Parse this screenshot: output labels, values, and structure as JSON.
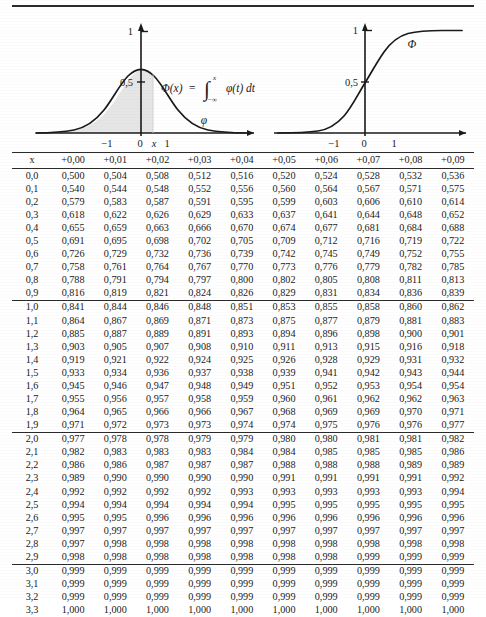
{
  "page": {
    "rule_color": "#2b2b2b"
  },
  "figures": [
    {
      "name": "density-figure",
      "caption_formula": "Φ(x) = ∫  φ(t) dt",
      "curve_label": "φ",
      "integral_symbol": "∫",
      "integral_upper": "x",
      "integral_lower": "−∞",
      "formula_lhs": "Φ(x)",
      "formula_eq": "=",
      "formula_integrand": "φ(t) dt",
      "y_ticks": [
        "1",
        "0,5"
      ],
      "x_ticks": [
        "−1",
        "0",
        "x",
        "1"
      ],
      "shaded": true,
      "shade_color": "#e6e6e6"
    },
    {
      "name": "cdf-figure",
      "curve_label": "Φ",
      "y_ticks": [
        "1",
        "0,5"
      ],
      "x_ticks": [
        "−1",
        "0",
        "1"
      ],
      "shaded": false
    }
  ],
  "table": {
    "columns": [
      "x",
      "+0,00",
      "+0,01",
      "+0,02",
      "+0,03",
      "+0,04",
      "+0,05",
      "+0,06",
      "+0,07",
      "+0,08",
      "+0,09"
    ],
    "blocks": [
      {
        "rows": [
          {
            "x": "0,0",
            "values": [
              "0,500",
              "0,504",
              "0,508",
              "0,512",
              "0,516",
              "0,520",
              "0,524",
              "0,528",
              "0,532",
              "0,536"
            ]
          },
          {
            "x": "0,1",
            "values": [
              "0,540",
              "0,544",
              "0,548",
              "0,552",
              "0,556",
              "0,560",
              "0,564",
              "0,567",
              "0,571",
              "0,575"
            ]
          },
          {
            "x": "0,2",
            "values": [
              "0,579",
              "0,583",
              "0,587",
              "0,591",
              "0,595",
              "0,599",
              "0,603",
              "0,606",
              "0,610",
              "0,614"
            ]
          },
          {
            "x": "0,3",
            "values": [
              "0,618",
              "0,622",
              "0,626",
              "0,629",
              "0,633",
              "0,637",
              "0,641",
              "0,644",
              "0,648",
              "0,652"
            ]
          },
          {
            "x": "0,4",
            "values": [
              "0,655",
              "0,659",
              "0,663",
              "0,666",
              "0,670",
              "0,674",
              "0,677",
              "0,681",
              "0,684",
              "0,688"
            ]
          },
          {
            "x": "0,5",
            "values": [
              "0,691",
              "0,695",
              "0,698",
              "0,702",
              "0,705",
              "0,709",
              "0,712",
              "0,716",
              "0,719",
              "0,722"
            ]
          },
          {
            "x": "0,6",
            "values": [
              "0,726",
              "0,729",
              "0,732",
              "0,736",
              "0,739",
              "0,742",
              "0,745",
              "0,749",
              "0,752",
              "0,755"
            ]
          },
          {
            "x": "0,7",
            "values": [
              "0,758",
              "0,761",
              "0,764",
              "0,767",
              "0,770",
              "0,773",
              "0,776",
              "0,779",
              "0,782",
              "0,785"
            ]
          },
          {
            "x": "0,8",
            "values": [
              "0,788",
              "0,791",
              "0,794",
              "0,797",
              "0,800",
              "0,802",
              "0,805",
              "0,808",
              "0,811",
              "0,813"
            ]
          },
          {
            "x": "0,9",
            "values": [
              "0,816",
              "0,819",
              "0,821",
              "0,824",
              "0,826",
              "0,829",
              "0,831",
              "0,834",
              "0,836",
              "0,839"
            ]
          }
        ]
      },
      {
        "rows": [
          {
            "x": "1,0",
            "values": [
              "0,841",
              "0,844",
              "0,846",
              "0,848",
              "0,851",
              "0,853",
              "0,855",
              "0,858",
              "0,860",
              "0,862"
            ]
          },
          {
            "x": "1,1",
            "values": [
              "0,864",
              "0,867",
              "0,869",
              "0,871",
              "0,873",
              "0,875",
              "0,877",
              "0,879",
              "0,881",
              "0,883"
            ]
          },
          {
            "x": "1,2",
            "values": [
              "0,885",
              "0,887",
              "0,889",
              "0,891",
              "0,893",
              "0,894",
              "0,896",
              "0,898",
              "0,900",
              "0,901"
            ]
          },
          {
            "x": "1,3",
            "values": [
              "0,903",
              "0,905",
              "0,907",
              "0,908",
              "0,910",
              "0,911",
              "0,913",
              "0,915",
              "0,916",
              "0,918"
            ]
          },
          {
            "x": "1,4",
            "values": [
              "0,919",
              "0,921",
              "0,922",
              "0,924",
              "0,925",
              "0,926",
              "0,928",
              "0,929",
              "0,931",
              "0,932"
            ]
          },
          {
            "x": "1,5",
            "values": [
              "0,933",
              "0,934",
              "0,936",
              "0,937",
              "0,938",
              "0,939",
              "0,941",
              "0,942",
              "0,943",
              "0,944"
            ]
          },
          {
            "x": "1,6",
            "values": [
              "0,945",
              "0,946",
              "0,947",
              "0,948",
              "0,949",
              "0,951",
              "0,952",
              "0,953",
              "0,954",
              "0,954"
            ]
          },
          {
            "x": "1,7",
            "values": [
              "0,955",
              "0,956",
              "0,957",
              "0,958",
              "0,959",
              "0,960",
              "0,961",
              "0,962",
              "0,962",
              "0,963"
            ]
          },
          {
            "x": "1,8",
            "values": [
              "0,964",
              "0,965",
              "0,966",
              "0,966",
              "0,967",
              "0,968",
              "0,969",
              "0,969",
              "0,970",
              "0,971"
            ]
          },
          {
            "x": "1,9",
            "values": [
              "0,971",
              "0,972",
              "0,973",
              "0,973",
              "0,974",
              "0,974",
              "0,975",
              "0,976",
              "0,976",
              "0,977"
            ]
          }
        ]
      },
      {
        "rows": [
          {
            "x": "2,0",
            "values": [
              "0,977",
              "0,978",
              "0,978",
              "0,979",
              "0,979",
              "0,980",
              "0,980",
              "0,981",
              "0,981",
              "0,982"
            ]
          },
          {
            "x": "2,1",
            "values": [
              "0,982",
              "0,983",
              "0,983",
              "0,983",
              "0,984",
              "0,984",
              "0,985",
              "0,985",
              "0,985",
              "0,986"
            ]
          },
          {
            "x": "2,2",
            "values": [
              "0,986",
              "0,986",
              "0,987",
              "0,987",
              "0,987",
              "0,988",
              "0,988",
              "0,988",
              "0,989",
              "0,989"
            ]
          },
          {
            "x": "2,3",
            "values": [
              "0,989",
              "0,990",
              "0,990",
              "0,990",
              "0,990",
              "0,991",
              "0,991",
              "0,991",
              "0,991",
              "0,992"
            ]
          },
          {
            "x": "2,4",
            "values": [
              "0,992",
              "0,992",
              "0,992",
              "0,992",
              "0,993",
              "0,993",
              "0,993",
              "0,993",
              "0,993",
              "0,994"
            ]
          },
          {
            "x": "2,5",
            "values": [
              "0,994",
              "0,994",
              "0,994",
              "0,994",
              "0,994",
              "0,995",
              "0,995",
              "0,995",
              "0,995",
              "0,995"
            ]
          },
          {
            "x": "2,6",
            "values": [
              "0,995",
              "0,995",
              "0,996",
              "0,996",
              "0,996",
              "0,996",
              "0,996",
              "0,996",
              "0,996",
              "0,996"
            ]
          },
          {
            "x": "2,7",
            "values": [
              "0,997",
              "0,997",
              "0,997",
              "0,997",
              "0,997",
              "0,997",
              "0,997",
              "0,997",
              "0,997",
              "0,997"
            ]
          },
          {
            "x": "2,8",
            "values": [
              "0,997",
              "0,998",
              "0,998",
              "0,998",
              "0,998",
              "0,998",
              "0,998",
              "0,998",
              "0,998",
              "0,998"
            ]
          },
          {
            "x": "2,9",
            "values": [
              "0,998",
              "0,998",
              "0,998",
              "0,998",
              "0,998",
              "0,998",
              "0,998",
              "0,999",
              "0,999",
              "0,999"
            ]
          }
        ]
      },
      {
        "rows": [
          {
            "x": "3,0",
            "values": [
              "0,999",
              "0,999",
              "0,999",
              "0,999",
              "0,999",
              "0,999",
              "0,999",
              "0,999",
              "0,999",
              "0,999"
            ]
          },
          {
            "x": "3,1",
            "values": [
              "0,999",
              "0,999",
              "0,999",
              "0,999",
              "0,999",
              "0,999",
              "0,999",
              "0,999",
              "0,999",
              "0,999"
            ]
          },
          {
            "x": "3,2",
            "values": [
              "0,999",
              "0,999",
              "0,999",
              "0,999",
              "0,999",
              "0,999",
              "0,999",
              "0,999",
              "0,999",
              "0,999"
            ]
          },
          {
            "x": "3,3",
            "values": [
              "1,000",
              "1,000",
              "1,000",
              "1,000",
              "1,000",
              "1,000",
              "1,000",
              "1,000",
              "1,000",
              "1,000"
            ]
          }
        ]
      }
    ]
  },
  "chart_data": [
    {
      "type": "line",
      "name": "standard-normal-density",
      "title": "",
      "xlabel": "",
      "ylabel": "",
      "series": [
        {
          "name": "φ",
          "x": [
            -3.2,
            -3.0,
            -2.75,
            -2.5,
            -2.25,
            -2.0,
            -1.75,
            -1.5,
            -1.25,
            -1.0,
            -0.75,
            -0.5,
            -0.25,
            0,
            0.25,
            0.5,
            0.75,
            1.0,
            1.25,
            1.5,
            1.75,
            2.0,
            2.25,
            2.5,
            2.75,
            3.0,
            3.2
          ],
          "y": [
            0.002,
            0.004,
            0.009,
            0.018,
            0.032,
            0.054,
            0.086,
            0.13,
            0.183,
            0.242,
            0.301,
            0.352,
            0.387,
            0.399,
            0.387,
            0.352,
            0.301,
            0.242,
            0.183,
            0.13,
            0.086,
            0.054,
            0.032,
            0.018,
            0.009,
            0.004,
            0.002
          ]
        }
      ],
      "shaded_region": {
        "from": -3.2,
        "to": 0.6,
        "label": "Φ(x)"
      },
      "ytick_labels": [
        "0,5",
        "1"
      ],
      "ytick_values": [
        0.5,
        1.0
      ],
      "xtick_labels": [
        "−1",
        "0",
        "x",
        "1"
      ],
      "xtick_values": [
        -1,
        0,
        0.6,
        1
      ],
      "annotations": [
        "Φ(x) = ∫_{−∞}^{x} φ(t) dt",
        "φ"
      ],
      "grid": false,
      "legend": "none"
    },
    {
      "type": "line",
      "name": "standard-normal-cdf",
      "title": "",
      "xlabel": "",
      "ylabel": "",
      "series": [
        {
          "name": "Φ",
          "x": [
            -3.2,
            -3.0,
            -2.5,
            -2.0,
            -1.5,
            -1.0,
            -0.5,
            0,
            0.5,
            1.0,
            1.5,
            2.0,
            2.5,
            3.0,
            3.2
          ],
          "y": [
            0.001,
            0.001,
            0.006,
            0.023,
            0.067,
            0.159,
            0.309,
            0.5,
            0.691,
            0.841,
            0.933,
            0.977,
            0.994,
            0.999,
            0.999
          ]
        }
      ],
      "ytick_labels": [
        "0,5",
        "1"
      ],
      "ytick_values": [
        0.5,
        1.0
      ],
      "xtick_labels": [
        "−1",
        "0",
        "1"
      ],
      "xtick_values": [
        -1,
        0,
        1
      ],
      "annotations": [
        "Φ"
      ],
      "grid": false,
      "legend": "none"
    }
  ]
}
